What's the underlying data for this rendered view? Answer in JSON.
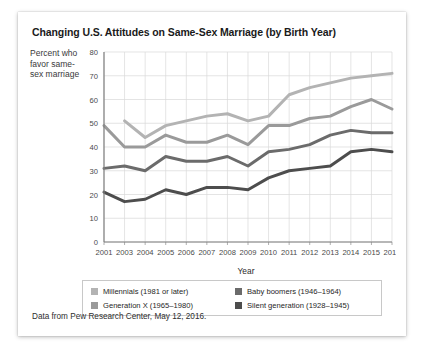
{
  "card": {
    "title": "Changing U.S. Attitudes on Same-Sex Marriage (by Birth Year)",
    "y_axis_caption": "Percent who favor same-sex marriage",
    "footer": "Data from Pew Research Center, May 12, 2016."
  },
  "legend": {
    "entries": [
      {
        "label": "Millennials (1981 or later)",
        "color": "#b3b3b3"
      },
      {
        "label": "Baby boomers (1946–1964)",
        "color": "#6b6b6b"
      },
      {
        "label": "Generation X (1965–1980)",
        "color": "#9a9a9a"
      },
      {
        "label": "Silent generation (1928–1945)",
        "color": "#4d4d4d"
      }
    ]
  },
  "chart_data": {
    "type": "line",
    "title": "Changing U.S. Attitudes on Same-Sex Marriage (by Birth Year)",
    "xlabel": "Year",
    "ylabel": "Percent who favor same-sex marriage",
    "xlim": [
      2001,
      2016
    ],
    "ylim": [
      0,
      80
    ],
    "ytick_step": 10,
    "yticks": [
      0,
      10,
      20,
      30,
      40,
      50,
      60,
      70,
      80
    ],
    "grid": true,
    "legend_position": "bottom",
    "categories": [
      2001,
      2003,
      2004,
      2005,
      2006,
      2007,
      2008,
      2009,
      2010,
      2011,
      2012,
      2013,
      2014,
      2015,
      2016
    ],
    "xtick_labels": [
      "2001",
      "2003",
      "2004",
      "2005",
      "2006",
      "2007",
      "2008",
      "2009",
      "2010",
      "2011",
      "2012",
      "2013",
      "2014",
      "2015",
      "2016"
    ],
    "series": [
      {
        "name": "Millennials (1981 or later)",
        "color": "#b3b3b3",
        "x": [
          2003,
          2004,
          2005,
          2006,
          2007,
          2008,
          2009,
          2010,
          2011,
          2012,
          2013,
          2014,
          2015,
          2016
        ],
        "values": [
          51,
          44,
          49,
          51,
          53,
          54,
          51,
          53,
          62,
          65,
          67,
          69,
          70,
          71
        ]
      },
      {
        "name": "Generation X (1965–1980)",
        "color": "#9a9a9a",
        "x": [
          2001,
          2003,
          2004,
          2005,
          2006,
          2007,
          2008,
          2009,
          2010,
          2011,
          2012,
          2013,
          2014,
          2015,
          2016
        ],
        "values": [
          49,
          40,
          40,
          45,
          42,
          42,
          45,
          41,
          49,
          49,
          52,
          53,
          57,
          60,
          56
        ]
      },
      {
        "name": "Baby boomers (1946–1964)",
        "color": "#6b6b6b",
        "x": [
          2001,
          2003,
          2004,
          2005,
          2006,
          2007,
          2008,
          2009,
          2010,
          2011,
          2012,
          2013,
          2014,
          2015,
          2016
        ],
        "values": [
          31,
          32,
          30,
          36,
          34,
          34,
          36,
          32,
          38,
          39,
          41,
          45,
          47,
          46,
          46
        ]
      },
      {
        "name": "Silent generation (1928–1945)",
        "color": "#4d4d4d",
        "x": [
          2001,
          2003,
          2004,
          2005,
          2006,
          2007,
          2008,
          2009,
          2010,
          2011,
          2012,
          2013,
          2014,
          2015,
          2016
        ],
        "values": [
          21,
          17,
          18,
          22,
          20,
          23,
          23,
          22,
          27,
          30,
          31,
          32,
          38,
          39,
          38
        ]
      }
    ]
  }
}
